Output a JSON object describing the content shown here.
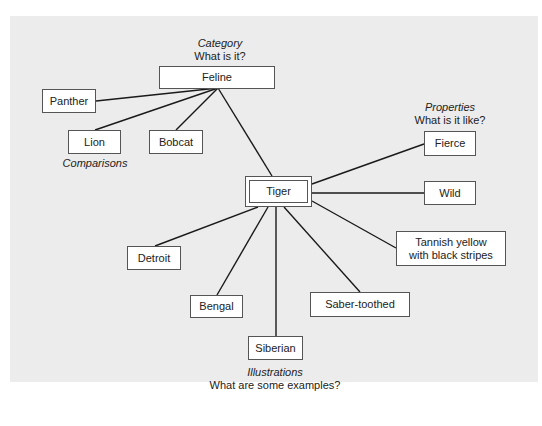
{
  "diagram": {
    "center": {
      "label": "Tiger"
    },
    "category": {
      "heading": "Category",
      "question": "What is it?",
      "node": "Feline"
    },
    "comparisons": {
      "heading": "Comparisons",
      "nodes": [
        "Panther",
        "Lion",
        "Bobcat"
      ]
    },
    "properties": {
      "heading": "Properties",
      "question": "What is it like?",
      "nodes": [
        "Fierce",
        "Wild",
        "Tannish yellow\nwith black stripes"
      ]
    },
    "illustrations": {
      "heading": "Illustrations",
      "question": "What are some examples?",
      "nodes": [
        "Detroit",
        "Bengal",
        "Siberian",
        "Saber-toothed"
      ]
    },
    "colors": {
      "panel": "#ececec",
      "box_border": "#555555",
      "line": "#1a1a1a"
    }
  }
}
